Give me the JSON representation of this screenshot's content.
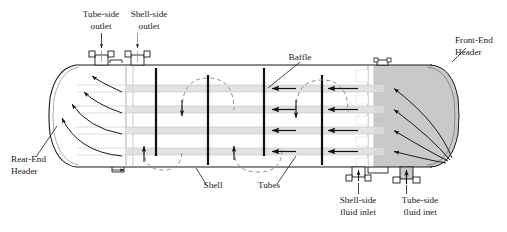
{
  "figure": {
    "background": "#ffffff",
    "line_color": "#1a1a1a",
    "header_fill": "#c9c9c9",
    "tube_fill": "#e2e2e2",
    "baffle_color": "#111111"
  },
  "labels": {
    "tube_side_outlet": {
      "line1": "Tube-side",
      "line2": "outlet"
    },
    "shell_side_outlet": {
      "line1": "Shell-side",
      "line2": "outlet"
    },
    "baffle": {
      "line1": "Baffle"
    },
    "front_end_header": {
      "line1": "Front-End",
      "line2": "Header"
    },
    "rear_end_header": {
      "line1": "Rear-End",
      "line2": "Header"
    },
    "shell": {
      "line1": "Shell"
    },
    "tubes": {
      "line1": "Tubes"
    },
    "shell_side_fluid_inlet": {
      "line1": "Shell-side",
      "line2": "fluid inlet"
    },
    "tube_side_fluid_inlet": {
      "line1": "Tube-side",
      "line2": "fluid inet"
    }
  },
  "components": {
    "baffle_count": 5,
    "tube_row_count": 4,
    "nozzle_count": 4,
    "nozzles": [
      "tube-side-outlet-nozzle",
      "shell-side-outlet-nozzle",
      "shell-side-inlet-nozzle",
      "tube-side-inlet-nozzle"
    ]
  }
}
